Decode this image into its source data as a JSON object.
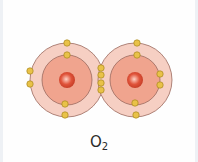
{
  "diagram": {
    "label": {
      "main": "O",
      "subscript": "2"
    },
    "colors": {
      "outer_shell": "#f6cfc3",
      "inner_shell": "#f0a48e",
      "shell_stroke": "#9a6a5e",
      "nucleus": "#e0533a",
      "nucleus_highlight": "#ffd2c4",
      "electron": "#e9c248",
      "electron_stroke": "#a8871e"
    },
    "atoms": [
      {
        "name": "oxygen-atom-left",
        "center": [
          67,
          80
        ],
        "outer_radius": 37,
        "inner_radius": 25,
        "nucleus_radius": 8,
        "electrons": [
          [
            67,
            43
          ],
          [
            67,
            55
          ],
          [
            65,
            104
          ],
          [
            65,
            115
          ],
          [
            30,
            71
          ],
          [
            30,
            84
          ]
        ]
      },
      {
        "name": "oxygen-atom-right",
        "center": [
          135,
          80
        ],
        "outer_radius": 37,
        "inner_radius": 25,
        "nucleus_radius": 8,
        "electrons": [
          [
            137,
            43
          ],
          [
            137,
            55
          ],
          [
            135,
            103
          ],
          [
            136,
            115
          ],
          [
            160,
            74
          ],
          [
            160,
            85
          ]
        ]
      }
    ],
    "shared_electrons": [
      [
        101,
        68
      ],
      [
        101,
        75
      ],
      [
        101,
        83
      ],
      [
        101,
        90
      ]
    ]
  }
}
